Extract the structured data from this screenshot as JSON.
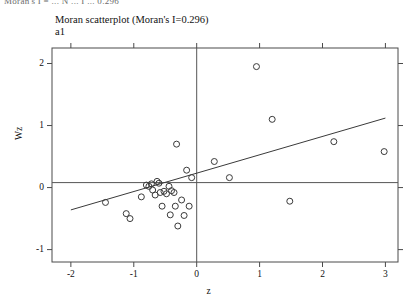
{
  "top_clipped_text": "Moran's I = ... N ... I ... 0.296",
  "chart_data": {
    "type": "scatter",
    "title": "Moran scatterplot (Moran's I=0.296)",
    "subtitle": "a1",
    "xlabel": "z",
    "ylabel": "Wz",
    "xlim": [
      -2.3,
      3.2
    ],
    "ylim": [
      -1.2,
      2.25
    ],
    "xticks": [
      -2,
      -1,
      0,
      1,
      2,
      3
    ],
    "ytick_labels": [
      "2",
      "1",
      "0",
      "-1"
    ],
    "yticks": [
      2,
      1,
      0,
      -1
    ],
    "grid": false,
    "morans_i": 0.296,
    "reference_lines": {
      "horizontal_y": 0.08,
      "vertical_x": 0.0
    },
    "fit_line": {
      "slope": 0.296,
      "intercept": 0.232,
      "x_start": -2.0,
      "x_end": 3.0,
      "y_start": -0.36,
      "y_end": 1.12
    },
    "marker": {
      "shape": "open-circle",
      "radius": 3.0,
      "color": "#3a3a3a"
    },
    "n_points": 33,
    "points": [
      {
        "x": -1.45,
        "y": -0.24
      },
      {
        "x": -1.12,
        "y": -0.42
      },
      {
        "x": -1.06,
        "y": -0.5
      },
      {
        "x": -0.88,
        "y": -0.15
      },
      {
        "x": -0.8,
        "y": 0.04
      },
      {
        "x": -0.76,
        "y": 0.02
      },
      {
        "x": -0.72,
        "y": 0.06
      },
      {
        "x": -0.7,
        "y": -0.04
      },
      {
        "x": -0.66,
        "y": -0.12
      },
      {
        "x": -0.63,
        "y": 0.1
      },
      {
        "x": -0.6,
        "y": 0.07
      },
      {
        "x": -0.58,
        "y": -0.08
      },
      {
        "x": -0.55,
        "y": -0.3
      },
      {
        "x": -0.52,
        "y": -0.06
      },
      {
        "x": -0.48,
        "y": -0.1
      },
      {
        "x": -0.44,
        "y": 0.02
      },
      {
        "x": -0.42,
        "y": -0.44
      },
      {
        "x": -0.4,
        "y": -0.05
      },
      {
        "x": -0.36,
        "y": -0.08
      },
      {
        "x": -0.34,
        "y": -0.3
      },
      {
        "x": -0.32,
        "y": 0.7
      },
      {
        "x": -0.3,
        "y": -0.62
      },
      {
        "x": -0.24,
        "y": -0.2
      },
      {
        "x": -0.2,
        "y": -0.45
      },
      {
        "x": -0.16,
        "y": 0.28
      },
      {
        "x": -0.12,
        "y": -0.3
      },
      {
        "x": -0.08,
        "y": 0.16
      },
      {
        "x": 0.28,
        "y": 0.42
      },
      {
        "x": 0.52,
        "y": 0.16
      },
      {
        "x": 0.95,
        "y": 1.95
      },
      {
        "x": 1.2,
        "y": 1.1
      },
      {
        "x": 1.48,
        "y": -0.22
      },
      {
        "x": 2.18,
        "y": 0.74
      },
      {
        "x": 2.98,
        "y": 0.58
      }
    ]
  }
}
